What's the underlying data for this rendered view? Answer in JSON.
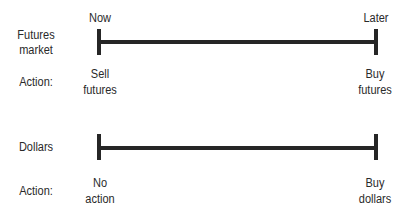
{
  "timeline_labels": {
    "start": "Now",
    "end": "Later"
  },
  "rows": [
    {
      "label_line1": "Futures",
      "label_line2": "market",
      "action_label": "Action:",
      "start_action_line1": "Sell",
      "start_action_line2": "futures",
      "end_action_line1": "Buy",
      "end_action_line2": "futures"
    },
    {
      "label_line1": "Dollars",
      "action_label": "Action:",
      "start_action_line1": "No",
      "start_action_line2": "action",
      "end_action_line1": "Buy",
      "end_action_line2": "dollars"
    }
  ],
  "colors": {
    "line": "#262626",
    "text": "#2a2a2a",
    "background": "#ffffff"
  }
}
